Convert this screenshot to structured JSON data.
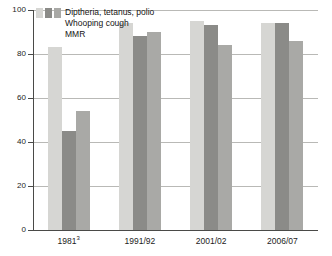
{
  "chart_data": {
    "type": "bar",
    "title": "",
    "subtitle": "",
    "xlabel": "",
    "ylabel": "",
    "ylim": [
      0,
      100
    ],
    "yticks": [
      0,
      20,
      40,
      60,
      80,
      100
    ],
    "ytick_labels": [
      "0",
      "20",
      "40",
      "60",
      "80",
      "100"
    ],
    "grid": "horizontal",
    "legend_position": "inside-top-left",
    "categories": [
      "1981",
      "1991/92",
      "2001/02",
      "2006/07"
    ],
    "category_labels": [
      "1981",
      "1991/92",
      "2001/02",
      "2006/07"
    ],
    "category_footnotes": [
      "3",
      "",
      "",
      ""
    ],
    "series": [
      {
        "name": "Diptheria, tetanus, polio",
        "color": "#d6d6d3",
        "values": [
          83,
          94,
          95,
          94
        ]
      },
      {
        "name": "Whooping cough",
        "color": "#8b8b88",
        "values": [
          45,
          88,
          93,
          94
        ]
      },
      {
        "name": "MMR",
        "color": "#a9a9a6",
        "values": [
          54,
          90,
          84,
          86
        ]
      }
    ]
  },
  "legend": {
    "items": [
      {
        "label": "Diptheria, tetanus, polio"
      },
      {
        "label": "Whooping cough"
      },
      {
        "label": "MMR"
      }
    ]
  },
  "axis": {
    "y_labels": [
      "100",
      "80",
      "60",
      "40",
      "20",
      "0"
    ]
  }
}
